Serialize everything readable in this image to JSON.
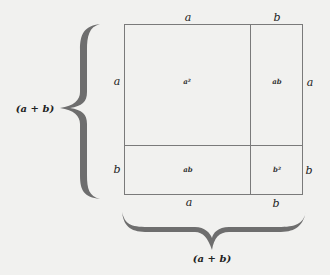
{
  "diagram": {
    "colors": {
      "background": "#f1f1ef",
      "lines": "#7a7a7a",
      "brace": "#6e6e6e",
      "text": "#222222"
    },
    "top_labels": [
      "a",
      "b"
    ],
    "bottom_labels": [
      "a",
      "b"
    ],
    "left_labels": [
      "a",
      "b"
    ],
    "right_labels": [
      "a",
      "b"
    ],
    "cells": {
      "top_left": "a²",
      "top_right": "ab",
      "bottom_left": "ab",
      "bottom_right": "b²"
    },
    "left_brace_label": "(a + b)",
    "bottom_brace_label": "(a + b)"
  }
}
